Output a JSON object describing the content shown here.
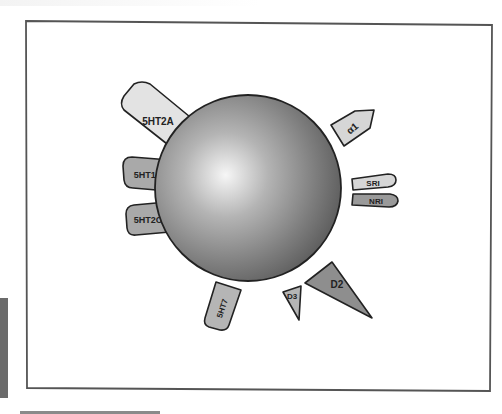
{
  "diagram": {
    "type": "receptor-binding-profile",
    "center": {
      "label": "",
      "shape": "sphere"
    },
    "receptors": [
      {
        "id": "5ht2a",
        "label": "5HT2A",
        "fill": "#e3e3e3"
      },
      {
        "id": "5ht1d",
        "label": "5HT1D",
        "fill": "#a9a9a9"
      },
      {
        "id": "5ht2c",
        "label": "5HT2C",
        "fill": "#a9a9a9"
      },
      {
        "id": "alpha1",
        "label": "α1",
        "fill": "#d6d6d6"
      },
      {
        "id": "sri",
        "label": "SRI",
        "fill": "#d6d6d6"
      },
      {
        "id": "nri",
        "label": "NRI",
        "fill": "#9a9a9a"
      },
      {
        "id": "5ht7",
        "label": "5HT7",
        "fill": "#b5b5b5"
      },
      {
        "id": "d3",
        "label": "D3",
        "fill": "#b5b5b5"
      },
      {
        "id": "d2",
        "label": "D2",
        "fill": "#8e8e8e"
      }
    ],
    "colors": {
      "frame": "#555555",
      "outline": "#222222",
      "sphere_highlight": "#f4f4f4",
      "sphere_shadow": "#5e5e5e"
    }
  }
}
